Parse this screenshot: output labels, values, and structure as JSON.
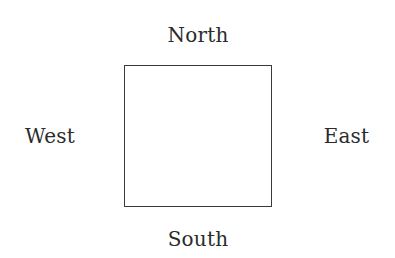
{
  "diagram": {
    "background_color": "#ffffff",
    "square": {
      "name": "center-square",
      "fill_color": "#ffffff",
      "border_color": "#3a3a3a",
      "border_width_px": 1,
      "x": 124,
      "y": 65,
      "width": 148,
      "height": 142
    },
    "labels": {
      "north": "North",
      "east": "East",
      "south": "South",
      "west": "West"
    },
    "label_color": "#2b2b2b",
    "label_font_size_px": 20
  }
}
